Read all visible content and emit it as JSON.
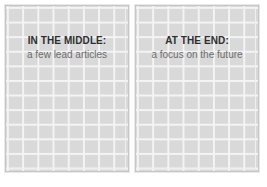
{
  "canvas": {
    "width": 267,
    "height": 187,
    "background": "#ffffff"
  },
  "theme": {
    "panel_fill": "#d9d9d9",
    "grid_line": "#f4f4f4",
    "panel_border": "#c6c6c6",
    "gutter": "#fdfdfd",
    "heading_color": "#2e2e2e",
    "subtitle_color": "#6d6d6d"
  },
  "spread": {
    "columns": 8,
    "rows": 11,
    "panels": [
      {
        "id": "left-page",
        "heading": "IN THE MIDDLE:",
        "subtitle": "a few lead articles"
      },
      {
        "id": "right-page",
        "heading": "AT THE END:",
        "subtitle": "a focus on the future"
      }
    ]
  }
}
